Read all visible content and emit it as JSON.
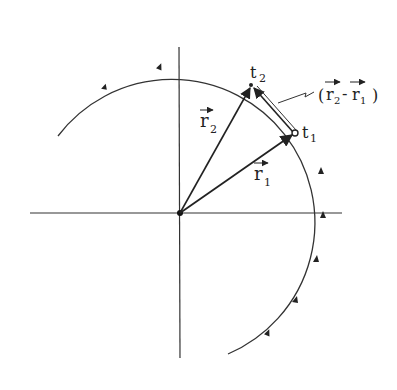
{
  "diagram": {
    "origin": [
      180,
      213
    ],
    "radius": 143,
    "colors": {
      "ink": "#222222",
      "background": "#ffffff"
    },
    "labels": {
      "t1": "t",
      "t1_sub": "1",
      "t2": "t",
      "t2_sub": "2",
      "r1": "r",
      "r1_sub": "1",
      "r2": "r",
      "r2_sub": "2",
      "diff_open": "(",
      "diff_r2": "r",
      "diff_r2_sub": "2",
      "diff_minus": "-",
      "diff_r1": "r",
      "diff_r1_sub": "1",
      "diff_close": ")"
    },
    "points": {
      "t1": [
        295,
        133
      ],
      "t2": [
        251,
        85
      ]
    },
    "direction": "counter-clockwise"
  }
}
